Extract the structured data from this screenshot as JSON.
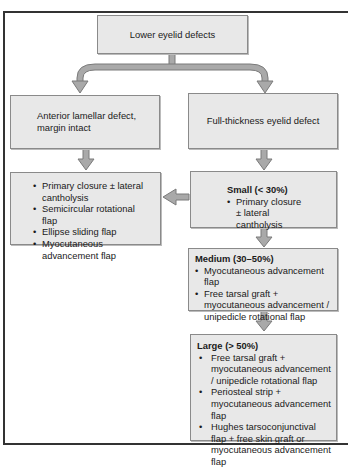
{
  "diagram": {
    "root": {
      "label": "Lower eyelid defects"
    },
    "left_branch": {
      "label": "Anterior lamellar defect, margin intact",
      "options": [
        "Primary closure ± lateral cantholysis",
        "Semicircular rotational flap",
        "Ellipse sliding flap",
        "Myocutaneous advancement flap"
      ]
    },
    "right_branch": {
      "label": "Full-thickness eyelid defect",
      "small": {
        "title": "Small (< 30%)",
        "items": [
          "Primary closure ± lateral cantholysis"
        ]
      },
      "medium": {
        "title": "Medium (30–50%)",
        "items": [
          "Myocutaneous advancement flap",
          "Free tarsal graft + myocutaneous advancement / unipedicle rotational flap"
        ]
      },
      "large": {
        "title": "Large (> 50%)",
        "items": [
          "Free tarsal graft + myocutaneous advancement / unipedicle rotational flap",
          "Periosteal strip + myocutaneous advancement flap",
          "Hughes tarsoconjunctival flap + free skin graft or myocutaneous advancement flap"
        ]
      }
    },
    "colors": {
      "box_fill": "#e8e8e8",
      "box_border": "#8a8a8a",
      "arrow_fill": "#a9a9a9",
      "arrow_stroke": "#7a7a7a",
      "frame": "#333333"
    }
  }
}
